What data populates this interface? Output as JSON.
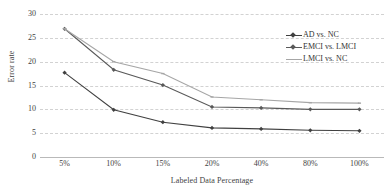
{
  "chart_data": {
    "type": "line",
    "title": "",
    "xlabel": "Labeled Data Percentage",
    "ylabel": "Error rate",
    "categories": [
      "5%",
      "10%",
      "15%",
      "20%",
      "40%",
      "80%",
      "100%"
    ],
    "ylim": [
      0,
      30
    ],
    "yticks": [
      0,
      5,
      10,
      15,
      20,
      25,
      30
    ],
    "grid": true,
    "legend_position": "top-right",
    "series": [
      {
        "name": "AD vs. NC",
        "color": "#404040",
        "marker": "diamond",
        "values": [
          17.7,
          9.9,
          7.3,
          6.1,
          5.9,
          5.6,
          5.5
        ]
      },
      {
        "name": "EMCI vs. LMCI",
        "color": "#595959",
        "marker": "diamond",
        "values": [
          26.9,
          18.3,
          15.1,
          10.5,
          10.3,
          10.0,
          10.0
        ]
      },
      {
        "name": "LMCI vs. NC",
        "color": "#a6a6a6",
        "marker": "dash",
        "values": [
          26.9,
          20.0,
          17.5,
          12.6,
          12.0,
          11.4,
          11.3
        ]
      }
    ]
  },
  "axis": {
    "y_tick_labels": [
      "30",
      "25",
      "20",
      "15",
      "10",
      "5",
      "0"
    ],
    "x_tick_labels": [
      "5%",
      "10%",
      "15%",
      "20%",
      "40%",
      "80%",
      "100%"
    ],
    "y_title": "Error rate",
    "x_title": "Labeled Data Percentage"
  },
  "legend": {
    "items": [
      {
        "label": "AD vs. NC"
      },
      {
        "label": "EMCI vs. LMCI"
      },
      {
        "label": "LMCI vs. NC"
      }
    ]
  },
  "colors": {
    "grid": "#d2d2d2",
    "axis": "#b9b9b9",
    "text": "#3f3f3f",
    "series1": "#404040",
    "series2": "#595959",
    "series3": "#a6a6a6"
  }
}
